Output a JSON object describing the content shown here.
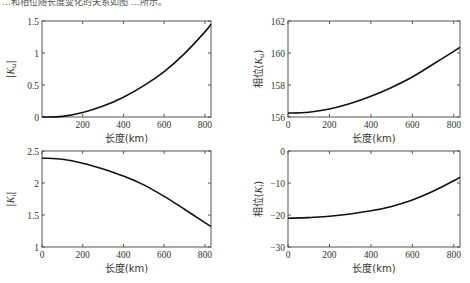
{
  "caption": "…和相位随长度变化的关系如图 …所示。",
  "chart_data": [
    {
      "type": "line",
      "id": "ku-magnitude",
      "title": "",
      "xlabel": "长度(km)",
      "ylabel": "|K_u|",
      "xlim": [
        0,
        830
      ],
      "ylim": [
        0,
        1.5
      ],
      "xticks": [
        200,
        400,
        600,
        800
      ],
      "yticks": [
        0,
        0.5,
        1,
        1.5
      ],
      "ytick_labels": [
        "0",
        "0.5",
        "1",
        "1.5"
      ],
      "grid": false,
      "x": [
        0,
        100,
        200,
        300,
        400,
        500,
        600,
        700,
        800,
        830
      ],
      "series": [
        {
          "name": "|Ku|",
          "values": [
            0,
            0.01,
            0.07,
            0.17,
            0.31,
            0.49,
            0.71,
            0.99,
            1.33,
            1.45
          ]
        }
      ]
    },
    {
      "type": "line",
      "id": "ku-phase",
      "title": "",
      "xlabel": "长度(km)",
      "ylabel": "相位(K_u)",
      "xlim": [
        0,
        830
      ],
      "ylim": [
        156,
        162
      ],
      "xticks": [
        0,
        200,
        400,
        600,
        800
      ],
      "yticks": [
        156,
        158,
        160,
        162
      ],
      "ytick_labels": [
        "156",
        "158",
        "160",
        "162"
      ],
      "grid": false,
      "x": [
        0,
        100,
        200,
        300,
        400,
        500,
        600,
        700,
        800,
        830
      ],
      "series": [
        {
          "name": "phase(Ku)",
          "values": [
            156.25,
            156.3,
            156.5,
            156.85,
            157.3,
            157.85,
            158.5,
            159.3,
            160.1,
            160.35
          ]
        }
      ]
    },
    {
      "type": "line",
      "id": "ki-magnitude",
      "title": "",
      "xlabel": "长度(km)",
      "ylabel": "|K_i|",
      "xlim": [
        0,
        830
      ],
      "ylim": [
        1,
        2.5
      ],
      "xticks": [
        0,
        200,
        400,
        600,
        800
      ],
      "yticks": [
        1,
        1.5,
        2,
        2.5
      ],
      "ytick_labels": [
        "1",
        "1.5",
        "2",
        "2.5"
      ],
      "grid": false,
      "x": [
        0,
        100,
        200,
        300,
        400,
        500,
        600,
        700,
        800,
        830
      ],
      "series": [
        {
          "name": "|Ki|",
          "values": [
            2.39,
            2.37,
            2.31,
            2.22,
            2.11,
            1.97,
            1.79,
            1.59,
            1.38,
            1.32
          ]
        }
      ]
    },
    {
      "type": "line",
      "id": "ki-phase",
      "title": "",
      "xlabel": "长度(km)",
      "ylabel": "相位(K_i)",
      "xlim": [
        0,
        830
      ],
      "ylim": [
        -30,
        0
      ],
      "xticks": [
        0,
        200,
        400,
        600,
        800
      ],
      "yticks": [
        -30,
        -20,
        -10,
        0
      ],
      "ytick_labels": [
        "−30",
        "−20",
        "−10",
        "0"
      ],
      "grid": false,
      "x": [
        0,
        100,
        200,
        300,
        400,
        500,
        600,
        700,
        800,
        830
      ],
      "series": [
        {
          "name": "phase(Ki)",
          "values": [
            -21,
            -20.8,
            -20.4,
            -19.7,
            -18.7,
            -17.3,
            -15.3,
            -12.6,
            -9.3,
            -8.2
          ]
        }
      ]
    }
  ],
  "panels": {
    "tl": {
      "ylabel": "|Ku|",
      "xlabel": "长度(km)"
    },
    "tr": {
      "ylabel": "相位(Ku)",
      "xlabel": "长度(km)"
    },
    "bl": {
      "ylabel": "|Ki|",
      "xlabel": "长度(km)"
    },
    "br": {
      "ylabel": "相位(Ki)",
      "xlabel": "长度(km)"
    }
  }
}
